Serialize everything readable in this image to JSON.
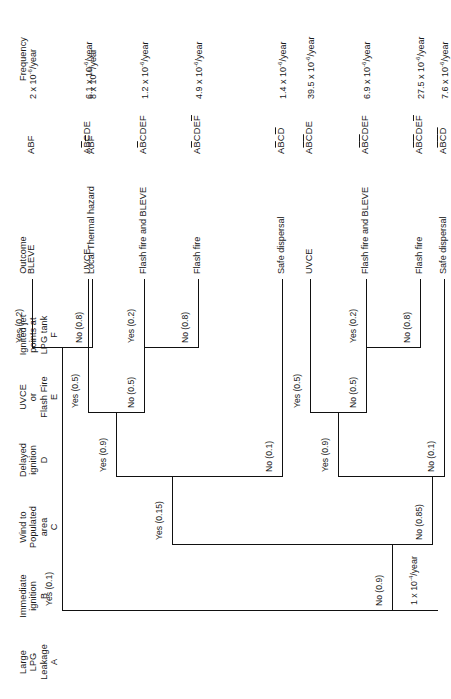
{
  "figure": {
    "type": "event-tree",
    "title": "",
    "initiating_frequency": "1 x 10<sup>-4</sup>/year"
  },
  "columns": {
    "headers": [
      {
        "id": "A",
        "lines": [
          "Large",
          "LPG",
          "Leakage",
          "A"
        ]
      },
      {
        "id": "B",
        "lines": [
          "Immediate",
          "ignition",
          "B"
        ]
      },
      {
        "id": "C",
        "lines": [
          "Wind to",
          "Populated",
          "area",
          "C"
        ]
      },
      {
        "id": "D",
        "lines": [
          "Delayed",
          "ignition",
          "D"
        ]
      },
      {
        "id": "E",
        "lines": [
          "UVCE",
          "or",
          "Flash Fire",
          "E"
        ]
      },
      {
        "id": "F",
        "lines": [
          "Ignited jet",
          "points at",
          "LPG tank",
          "F"
        ]
      },
      {
        "id": "outcome",
        "lines": [
          "Outcome"
        ]
      },
      {
        "id": "code",
        "lines": [
          ""
        ]
      },
      {
        "id": "frequency",
        "lines": [
          "Frequency"
        ]
      }
    ]
  },
  "branches": {
    "b_yes": "Yes (0.1)",
    "b_no": "No (0.9)",
    "c_yes": "Yes (0.15)",
    "c_no": "No (0.85)",
    "d1_yes": "Yes (0.9)",
    "d1_no": "No (0.1)",
    "d2_yes": "Yes (0.9)",
    "d2_no": "No (0.1)",
    "e1_yes": "Yes (0.5)",
    "e1_no": "No (0.5)",
    "e2_yes": "Yes (0.5)",
    "e2_no": "No (0.5)",
    "f0_yes": "Yes (0.2)",
    "f0_no": "No (0.8)",
    "f1_yes": "Yes (0.2)",
    "f1_no": "No (0.8)",
    "f2_yes": "Yes (0.2)",
    "f2_no": "No (0.8)"
  },
  "rows": [
    {
      "outcome": "BLEVE",
      "code": "ABF",
      "code_bars": [],
      "frequency": "2 x 10<sup>-6</sup>/year"
    },
    {
      "outcome": "Local Thermal hazard",
      "code": "ABF",
      "code_bars": [
        2
      ],
      "frequency": "8 x 10<sup>-6</sup>/year"
    },
    {
      "outcome": "UVCE",
      "code": "ABCDE",
      "code_bars": [
        1
      ],
      "frequency": "6.1 x 10<sup>-6</sup>/year"
    },
    {
      "outcome": "Flash fire and BLEVE",
      "code": "ABCDEF",
      "code_bars": [
        1
      ],
      "frequency": "1.2 x 10<sup>-6</sup>/year"
    },
    {
      "outcome": "Flash fire",
      "code": "ABCDEF",
      "code_bars": [
        1,
        5
      ],
      "frequency": "4.9 x 10<sup>-6</sup>/year"
    },
    {
      "outcome": "Safe dispersal",
      "code": "ABCD",
      "code_bars": [
        1,
        3
      ],
      "frequency": "1.4 x 10<sup>-6</sup>/year"
    },
    {
      "outcome": "UVCE",
      "code": "ABCDE",
      "code_bars": [
        1,
        2
      ],
      "frequency": "39.5 x 10<sup>-6</sup>/year"
    },
    {
      "outcome": "Flash fire and BLEVE",
      "code": "ABCDEF",
      "code_bars": [
        1,
        2
      ],
      "frequency": "6.9 x 10<sup>-6</sup>/year"
    },
    {
      "outcome": "Flash fire",
      "code": "ABCDEF",
      "code_bars": [
        1,
        2,
        5
      ],
      "frequency": "27.5 x 10<sup>-6</sup>/year"
    },
    {
      "outcome": "Safe dispersal",
      "code": "ABCD",
      "code_bars": [
        1,
        2,
        3
      ],
      "frequency": "7.6 x 10<sup>-6</sup>/year"
    }
  ],
  "total": {
    "label": "TOTAL",
    "value": "1 x 10<sup>-4</sup>/year"
  }
}
